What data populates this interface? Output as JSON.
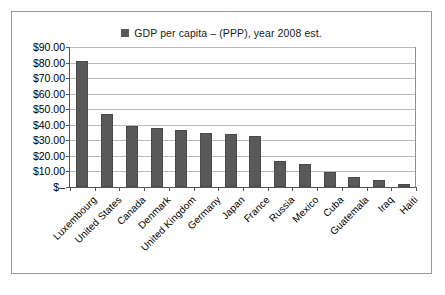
{
  "legend": {
    "marker": "legend-swatch",
    "label": "GDP per capita – (PPP), year 2008 est."
  },
  "chart_data": {
    "type": "bar",
    "title": "GDP per capita – (PPP), year 2008 est.",
    "xlabel": "",
    "ylabel": "",
    "ylim": [
      0,
      90
    ],
    "ytick_labels": [
      "$90.00",
      "$80.00",
      "$70.00",
      "$60.00",
      "$50.00",
      "$40.00",
      "$30.00",
      "$20.00",
      "$10.00",
      "$–"
    ],
    "ytick_values": [
      90,
      80,
      70,
      60,
      50,
      40,
      30,
      20,
      10,
      0
    ],
    "grid": true,
    "legend_position": "top-center",
    "bar_color": "#595959",
    "categories": [
      "Luxembourg",
      "United States",
      "Canada",
      "Denmark",
      "United Kingdom",
      "Germany",
      "Japan",
      "France",
      "Russia",
      "Mexico",
      "Cuba",
      "Guatemala",
      "Iraq",
      "Haiti"
    ],
    "values": [
      81,
      47,
      39,
      37.8,
      36.6,
      35,
      34.2,
      33,
      16.5,
      14.5,
      9.9,
      6.3,
      4.6,
      2
    ]
  }
}
